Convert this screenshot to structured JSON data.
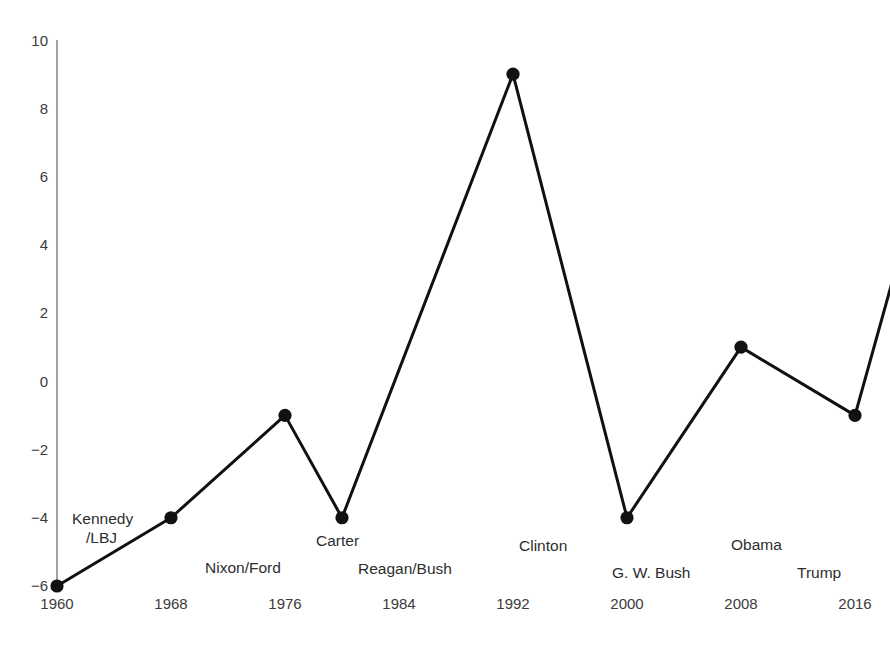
{
  "chart_data": {
    "type": "line",
    "title": "",
    "xlabel": "",
    "ylabel": "",
    "xlim": [
      1958,
      2021
    ],
    "ylim": [
      -6.6,
      10.4
    ],
    "xticks": [
      "1960",
      "1968",
      "1976",
      "1984",
      "1992",
      "2000",
      "2008",
      "2016"
    ],
    "xtick_values": [
      1960,
      1968,
      1976,
      1984,
      1992,
      2000,
      2008,
      2016
    ],
    "yticks": [
      "10",
      "8",
      "6",
      "4",
      "2",
      "0",
      "−2",
      "−4",
      "−6"
    ],
    "ytick_values": [
      10,
      8,
      6,
      4,
      2,
      0,
      -2,
      -4,
      -6
    ],
    "grid": false,
    "legend": false,
    "x": [
      1960,
      1968,
      1976,
      1980,
      1992,
      2000,
      2008,
      2016,
      2020
    ],
    "values": [
      -6,
      -4,
      -1,
      -4,
      9,
      -4,
      1,
      -1,
      5
    ],
    "series": [
      {
        "name": "series-1",
        "x": [
          1960,
          1968,
          1976,
          1980,
          1992,
          2000,
          2008,
          2016,
          2020
        ],
        "values": [
          -6,
          -4,
          -1,
          -4,
          9,
          -4,
          1,
          -1,
          5
        ],
        "color": "#111111",
        "marker": "circle",
        "line_width": 3
      }
    ],
    "annotations": [
      {
        "text": "Kennedy\n/LBJ",
        "x": 1962,
        "y": -4.1,
        "lines": [
          "Kennedy",
          "/LBJ"
        ]
      },
      {
        "text": "Nixon/Ford",
        "x": 1968,
        "y": -5.6,
        "lines": [
          "Nixon/Ford"
        ]
      },
      {
        "text": "Carter",
        "x": 1978,
        "y": -4.3,
        "lines": [
          "Carter"
        ]
      },
      {
        "text": "Reagan/Bush",
        "x": 1984,
        "y": -5.55,
        "lines": [
          "Reagan/Bush"
        ]
      },
      {
        "text": "Clinton",
        "x": 1993,
        "y": -4.65,
        "lines": [
          "Clinton"
        ]
      },
      {
        "text": "G. W. Bush",
        "x": 1999,
        "y": -5.6,
        "lines": [
          "G. W. Bush"
        ]
      },
      {
        "text": "Obama",
        "x": 2008,
        "y": -4.75,
        "lines": [
          "Obama"
        ]
      },
      {
        "text": "Trump",
        "x": 2014,
        "y": -5.65,
        "lines": [
          "Trump"
        ]
      }
    ]
  },
  "axis": {
    "y_spine_color": "#7a7a7a",
    "marker_color": "#111111",
    "line_color": "#111111"
  },
  "labels": {
    "ytick_0": "10",
    "ytick_1": "8",
    "ytick_2": "6",
    "ytick_3": "4",
    "ytick_4": "2",
    "ytick_5": "0",
    "ytick_6": "−2",
    "ytick_7": "−4",
    "ytick_8": "−6",
    "xtick_0": "1960",
    "xtick_1": "1968",
    "xtick_2": "1976",
    "xtick_3": "1984",
    "xtick_4": "1992",
    "xtick_5": "2000",
    "xtick_6": "2008",
    "xtick_7": "2016",
    "annot_kennedy_l1": "Kennedy",
    "annot_kennedy_l2": "/LBJ",
    "annot_nixon": "Nixon/Ford",
    "annot_carter": "Carter",
    "annot_reagan": "Reagan/Bush",
    "annot_clinton": "Clinton",
    "annot_gwbush": "G. W. Bush",
    "annot_obama": "Obama",
    "annot_trump": "Trump"
  }
}
